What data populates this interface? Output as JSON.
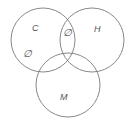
{
  "diagram": {
    "type": "venn",
    "sets": [
      {
        "label": "C",
        "cx": 43,
        "cy": 40,
        "r": 32
      },
      {
        "label": "H",
        "cx": 92,
        "cy": 40,
        "r": 32
      },
      {
        "label": "M",
        "cx": 68,
        "cy": 85,
        "r": 32
      }
    ],
    "labels": {
      "set_c": "C",
      "set_h": "H",
      "set_m": "M",
      "c_and_h_only": "∅",
      "c_only": "∅"
    },
    "colors": {
      "stroke": "#7a7a7a",
      "text": "#555555",
      "background": "#ffffff"
    }
  }
}
